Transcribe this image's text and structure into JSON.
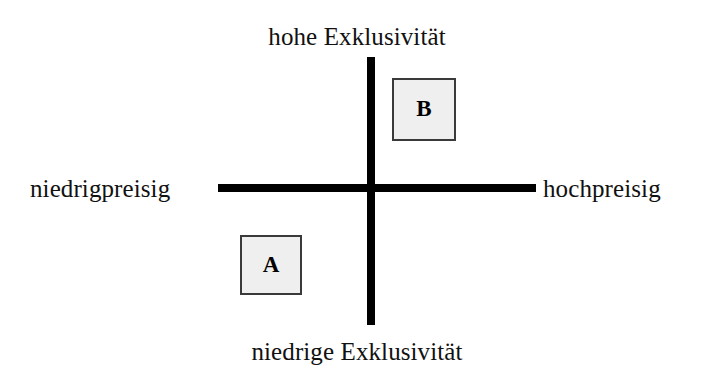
{
  "diagram": {
    "type": "positioning-matrix",
    "title_visible": false,
    "background_color": "#ffffff",
    "axis_color": "#000000"
  },
  "axes": {
    "vertical": {
      "top_label": "hohe Exklusivität",
      "bottom_label": "niedrige Exklusivität",
      "dimension": "Exklusivität"
    },
    "horizontal": {
      "left_label": "niedrigpreisig",
      "right_label": "hochpreisig",
      "dimension": "Preis"
    }
  },
  "markers": [
    {
      "id": "a",
      "label": "A",
      "quadrant": "unten-links",
      "price_position": "niedrigpreisig",
      "exclusivity_position": "niedrige Exklusivität",
      "fill_color": "#efefef",
      "border_color": "#3a3a3a"
    },
    {
      "id": "b",
      "label": "B",
      "quadrant": "oben-rechts",
      "price_position": "hochpreisig",
      "exclusivity_position": "hohe Exklusivität",
      "fill_color": "#efefef",
      "border_color": "#3a3a3a"
    }
  ]
}
